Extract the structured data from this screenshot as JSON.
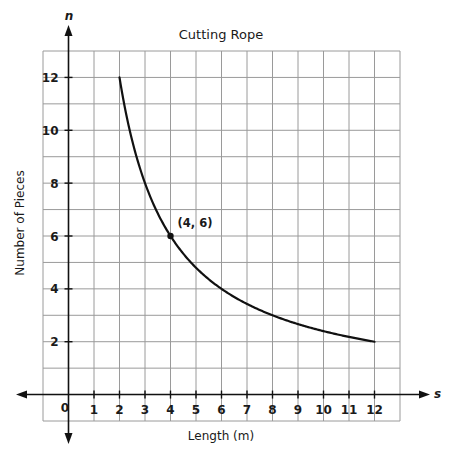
{
  "chart_data": {
    "type": "line",
    "title": "Cutting Rope",
    "xlabel": "Length (m)",
    "ylabel": "Number of Pieces",
    "x_var": "s",
    "y_var": "n",
    "xlim": [
      -1,
      13
    ],
    "ylim": [
      -1,
      13
    ],
    "x_ticks": [
      1,
      2,
      3,
      4,
      5,
      6,
      7,
      8,
      9,
      10,
      11,
      12
    ],
    "y_ticks": [
      2,
      4,
      6,
      8,
      10,
      12
    ],
    "origin_label": "0",
    "grid": true,
    "legend": "none",
    "series": [
      {
        "name": "n = 24/s",
        "x": [
          2,
          3,
          4,
          5,
          6,
          7,
          8,
          9,
          10,
          11,
          12
        ],
        "y": [
          12,
          8,
          6,
          4.8,
          4,
          3.43,
          3,
          2.67,
          2.4,
          2.18,
          2
        ],
        "color": "#111111"
      }
    ],
    "annotations": [
      {
        "x": 4,
        "y": 6,
        "label": "(4, 6)"
      }
    ]
  },
  "labels": {
    "title": "Cutting Rope",
    "xlabel": "Length (m)",
    "ylabel": "Number of Pieces",
    "x_var": "s",
    "y_var": "n",
    "origin": "0",
    "point_label": "(4, 6)"
  },
  "colors": {
    "grid": "#9a9a9a",
    "axis": "#111111",
    "curve": "#111111"
  }
}
